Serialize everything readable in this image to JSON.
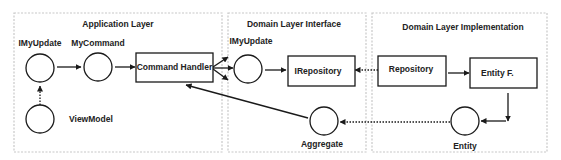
{
  "layers": [
    {
      "id": "application",
      "title": "Application Layer"
    },
    {
      "id": "domain-interface",
      "title": "Domain Layer Interface"
    },
    {
      "id": "domain-implementation",
      "title": "Domain Layer Implementation"
    }
  ],
  "nodes": {
    "imyupdate_app": {
      "label": "IMyUpdate",
      "shape": "circle"
    },
    "mycommand": {
      "label": "MyCommand",
      "shape": "circle"
    },
    "viewmodel": {
      "label": "ViewModel",
      "shape": "circle"
    },
    "command_handler": {
      "label": "Command Handler",
      "shape": "rect"
    },
    "imyupdate_domain": {
      "label": "IMyUpdate",
      "shape": "circle"
    },
    "irepository": {
      "label": "IRepository",
      "shape": "rect"
    },
    "aggregate": {
      "label": "Aggregate",
      "shape": "circle"
    },
    "repository": {
      "label": "Repository",
      "shape": "rect"
    },
    "entity_factory": {
      "label": "Entity F.",
      "shape": "rect"
    },
    "entity": {
      "label": "Entity",
      "shape": "circle"
    }
  },
  "edges": [
    {
      "from": "viewmodel",
      "to": "imyupdate_app",
      "style": "dotted"
    },
    {
      "from": "imyupdate_app",
      "to": "mycommand",
      "style": "solid"
    },
    {
      "from": "mycommand",
      "to": "command_handler",
      "style": "solid"
    },
    {
      "from": "command_handler",
      "to": "domain-interface",
      "style": "solid",
      "note": "three arrows fanning out"
    },
    {
      "from": "imyupdate_domain",
      "to": "irepository",
      "style": "solid"
    },
    {
      "from": "repository",
      "to": "irepository",
      "style": "dotted"
    },
    {
      "from": "repository",
      "to": "entity_factory",
      "style": "solid"
    },
    {
      "from": "entity_factory",
      "to": "entity",
      "style": "solid"
    },
    {
      "from": "entity",
      "to": "aggregate",
      "style": "dotted"
    },
    {
      "from": "aggregate",
      "to": "command_handler",
      "style": "solid"
    }
  ]
}
